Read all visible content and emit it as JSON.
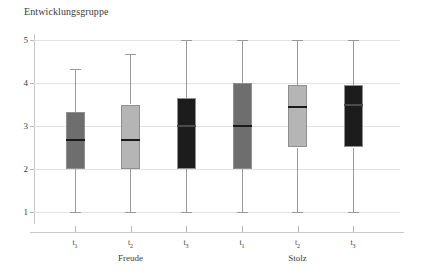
{
  "chart_data": {
    "type": "box",
    "title": "Entwicklungsgruppe",
    "xlabel": "",
    "ylabel": "",
    "ylim": [
      1,
      5
    ],
    "y_ticks": [
      1,
      2,
      3,
      4,
      5
    ],
    "y_tick_labels": [
      "1",
      "2",
      "3",
      "4",
      "5"
    ],
    "grid": true,
    "legend": "none",
    "group_labels": [
      "Freude",
      "Stolz"
    ],
    "categories": [
      "t1",
      "t2",
      "t3",
      "t1",
      "t2",
      "t3"
    ],
    "category_labels": [
      "t",
      "t",
      "t",
      "t",
      "t",
      "t"
    ],
    "category_subscripts": [
      "1",
      "2",
      "3",
      "1",
      "2",
      "3"
    ],
    "boxes": [
      {
        "label": "t1",
        "group": "Freude",
        "lower_whisker": 1.0,
        "q1": 2.0,
        "median": 2.67,
        "q3": 3.33,
        "upper_whisker": 4.33,
        "color": "#6e6e6e"
      },
      {
        "label": "t2",
        "group": "Freude",
        "lower_whisker": 1.0,
        "q1": 2.0,
        "median": 2.67,
        "q3": 3.5,
        "upper_whisker": 4.67,
        "color": "#b5b5b5"
      },
      {
        "label": "t3",
        "group": "Freude",
        "lower_whisker": 1.0,
        "q1": 2.0,
        "median": 3.0,
        "q3": 3.65,
        "upper_whisker": 5.0,
        "color": "#1c1c1c"
      },
      {
        "label": "t1",
        "group": "Stolz",
        "lower_whisker": 1.0,
        "q1": 2.0,
        "median": 3.0,
        "q3": 4.0,
        "upper_whisker": 5.0,
        "color": "#6e6e6e"
      },
      {
        "label": "t2",
        "group": "Stolz",
        "lower_whisker": 1.0,
        "q1": 2.5,
        "median": 3.45,
        "q3": 3.95,
        "upper_whisker": 5.0,
        "color": "#b5b5b5"
      },
      {
        "label": "t3",
        "group": "Stolz",
        "lower_whisker": 1.0,
        "q1": 2.5,
        "median": 3.5,
        "q3": 3.95,
        "upper_whisker": 5.0,
        "color": "#1c1c1c"
      }
    ]
  },
  "colors": {
    "background": "#ffffff",
    "gridline": "#e2e2e2",
    "axis": "#c9c9c9",
    "text": "#3c3c3c",
    "dark_gray_box": "#6e6e6e",
    "light_gray_box": "#b5b5b5",
    "black_box": "#1c1c1c",
    "box_border": "#8f8f8f",
    "whisker": "#9a9a9a",
    "median": "#1a1a1a"
  }
}
